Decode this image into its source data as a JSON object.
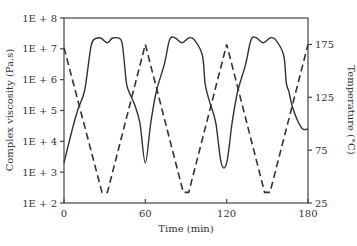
{
  "chart_data": {
    "type": "line",
    "title": "",
    "xlabel": "Time (min)",
    "ylabel": "Complex viscosity (Pa.s)",
    "y2label": "Temperature (°C)",
    "xlim": [
      0,
      180
    ],
    "ylim_log10": [
      2,
      8
    ],
    "y2lim": [
      25,
      200
    ],
    "x_ticks": [
      "0",
      "60",
      "120",
      "180"
    ],
    "y_ticks": [
      "1E + 2",
      "1E + 3",
      "1E + 4",
      "1E + 5",
      "1E + 6",
      "1E + 7",
      "1E + 8"
    ],
    "y2_ticks": [
      "25",
      "75",
      "125",
      "175"
    ],
    "grid": false,
    "legend": null,
    "series": [
      {
        "name": "Complex viscosity",
        "axis": "left",
        "style": "solid",
        "x": [
          0,
          5,
          10,
          15,
          18,
          20,
          22,
          27,
          32,
          36,
          42,
          44,
          46,
          48,
          52,
          56,
          60,
          64,
          68,
          74,
          78,
          82,
          87,
          92,
          96,
          102,
          104,
          106,
          108,
          112,
          116,
          120,
          124,
          128,
          134,
          138,
          142,
          147,
          152,
          156,
          162,
          164,
          166,
          168,
          172,
          176,
          180
        ],
        "log10_values": [
          3.3,
          4.2,
          5.0,
          5.6,
          6.5,
          7.1,
          7.3,
          7.35,
          7.2,
          7.35,
          7.3,
          6.8,
          5.9,
          5.6,
          5.2,
          4.6,
          3.3,
          4.6,
          5.6,
          6.5,
          7.3,
          7.35,
          7.2,
          7.35,
          7.3,
          6.8,
          5.9,
          5.5,
          5.2,
          4.6,
          3.3,
          3.3,
          4.6,
          5.6,
          6.5,
          7.3,
          7.35,
          7.2,
          7.35,
          7.3,
          6.8,
          5.9,
          5.6,
          5.2,
          4.7,
          4.4,
          4.4
        ]
      },
      {
        "name": "Temperature",
        "axis": "right",
        "style": "dashed",
        "x": [
          0,
          28,
          32,
          60,
          88,
          92,
          120,
          148,
          152,
          180
        ],
        "values": [
          172,
          35,
          35,
          175,
          35,
          35,
          175,
          35,
          35,
          175
        ]
      }
    ]
  }
}
